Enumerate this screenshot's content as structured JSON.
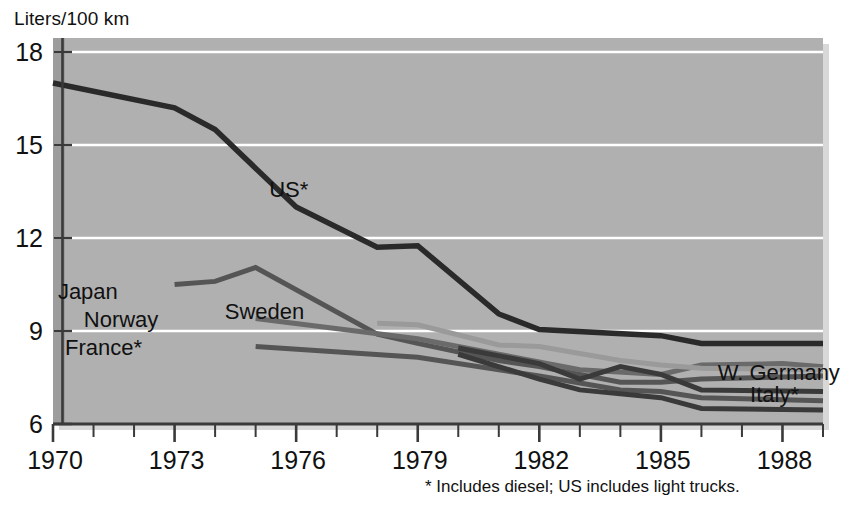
{
  "chart_data": {
    "type": "line",
    "title": "",
    "ylabel": "Liters/100 km",
    "xlabel": "",
    "xlim": [
      1970,
      1989
    ],
    "ylim": [
      6,
      18
    ],
    "yticks": [
      6,
      9,
      12,
      15,
      18
    ],
    "xticks": [
      1970,
      1973,
      1976,
      1979,
      1982,
      1985,
      1988
    ],
    "xtick_labels": [
      "1970",
      "1973",
      "1976",
      "1979",
      "1982",
      "1985",
      "1988"
    ],
    "ytick_labels": [
      "6",
      "9",
      "12",
      "15",
      "18"
    ],
    "minor_xticks_every": 1,
    "grid": "horizontal-white-lines",
    "legend_position": "inline-labels",
    "plot_background": "#b0b0b0",
    "series": [
      {
        "name": "US*",
        "label": "US*",
        "color": "#2a2a2a",
        "width": 5.5,
        "label_x": 1976.3,
        "label_y": 13.55,
        "points": [
          [
            1970,
            17.0
          ],
          [
            1973,
            16.2
          ],
          [
            1974,
            15.5
          ],
          [
            1976,
            13.0
          ],
          [
            1978,
            11.7
          ],
          [
            1979,
            11.75
          ],
          [
            1981,
            9.55
          ],
          [
            1982,
            9.05
          ],
          [
            1985,
            8.85
          ],
          [
            1986,
            8.6
          ],
          [
            1989,
            8.6
          ]
        ]
      },
      {
        "name": "Japan",
        "label": "Japan",
        "color": "#555555",
        "width": 5.0,
        "label_x": 1971.6,
        "label_y": 10.25,
        "points": [
          [
            1973,
            10.5
          ],
          [
            1974,
            10.6
          ],
          [
            1975,
            11.05
          ],
          [
            1978,
            8.9
          ],
          [
            1979,
            8.6
          ],
          [
            1981,
            8.05
          ],
          [
            1982,
            7.85
          ],
          [
            1984,
            7.35
          ],
          [
            1985,
            7.35
          ],
          [
            1986,
            7.45
          ],
          [
            1989,
            7.55
          ]
        ]
      },
      {
        "name": "Norway",
        "label": "Norway",
        "color": "#6a6a6a",
        "width": 5.0,
        "label_x": 1972.6,
        "label_y": 9.35,
        "points": [
          [
            1975,
            9.4
          ],
          [
            1979,
            8.75
          ],
          [
            1981,
            8.25
          ],
          [
            1983,
            7.75
          ],
          [
            1985,
            7.6
          ],
          [
            1986,
            7.9
          ],
          [
            1988,
            7.95
          ],
          [
            1989,
            7.85
          ]
        ]
      },
      {
        "name": "France*",
        "label": "France*",
        "color": "#555555",
        "width": 5.0,
        "label_x": 1972.2,
        "label_y": 8.45,
        "points": [
          [
            1975,
            8.5
          ],
          [
            1979,
            8.15
          ],
          [
            1982,
            7.55
          ],
          [
            1984,
            7.1
          ],
          [
            1985,
            7.05
          ],
          [
            1986,
            6.85
          ],
          [
            1989,
            6.75
          ]
        ]
      },
      {
        "name": "Sweden",
        "label": "Sweden",
        "color": "#9a9a9a",
        "width": 5.0,
        "label_x": 1976.2,
        "label_y": 9.6,
        "points": [
          [
            1978,
            9.25
          ],
          [
            1979,
            9.2
          ],
          [
            1981,
            8.55
          ],
          [
            1982,
            8.5
          ],
          [
            1984,
            8.05
          ],
          [
            1985,
            7.9
          ],
          [
            1986,
            7.8
          ],
          [
            1989,
            7.75
          ]
        ]
      },
      {
        "name": "W. Germany",
        "label": "W. Germany",
        "color": "#3a3a3a",
        "width": 5.0,
        "label_x": 1986.4,
        "label_y": 7.65,
        "points": [
          [
            1980,
            8.45
          ],
          [
            1982,
            7.95
          ],
          [
            1983,
            7.45
          ],
          [
            1984,
            7.85
          ],
          [
            1985,
            7.6
          ],
          [
            1986,
            7.1
          ],
          [
            1989,
            7.05
          ]
        ]
      },
      {
        "name": "Italy*",
        "label": "Italy*",
        "color": "#3a3a3a",
        "width": 5.0,
        "label_x": 1987.2,
        "label_y": 6.95,
        "points": [
          [
            1980,
            8.25
          ],
          [
            1982,
            7.45
          ],
          [
            1983,
            7.1
          ],
          [
            1985,
            6.85
          ],
          [
            1986,
            6.5
          ],
          [
            1989,
            6.45
          ]
        ]
      }
    ]
  },
  "footnote": {
    "text": "* Includes diesel; US includes light trucks."
  }
}
